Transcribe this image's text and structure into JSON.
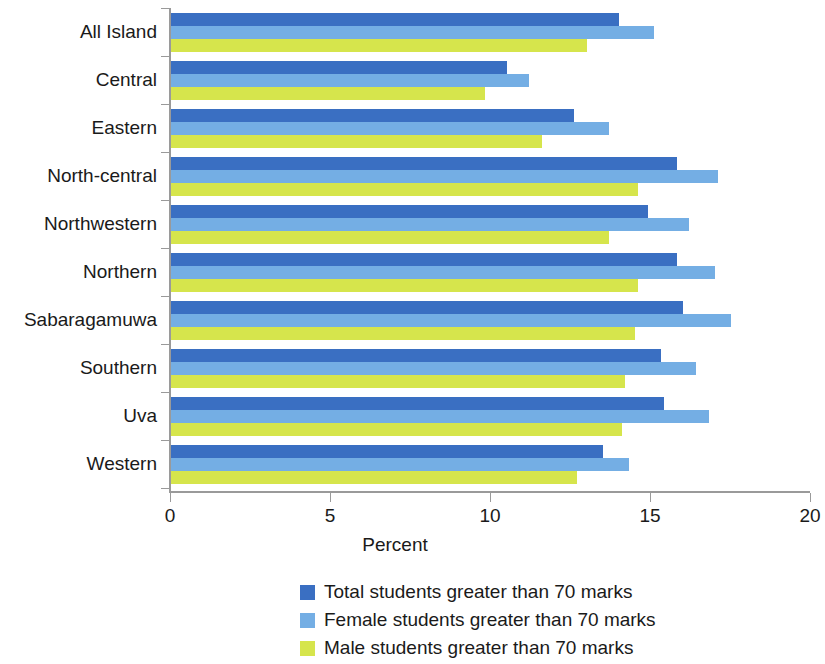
{
  "chart_data": {
    "type": "bar",
    "orientation": "horizontal",
    "title": "",
    "xlabel": "Percent",
    "ylabel": "",
    "xlim": [
      0,
      20
    ],
    "xticks": [
      0,
      5,
      10,
      15,
      20
    ],
    "xtick_labels": [
      "0",
      "5",
      "10",
      "15",
      "20"
    ],
    "grid": false,
    "legend_position": "bottom",
    "categories": [
      "All Island",
      "Central",
      "Eastern",
      "North-central",
      "Northwestern",
      "Northern",
      "Sabaragamuwa",
      "Southern",
      "Uva",
      "Western"
    ],
    "series": [
      {
        "name": "Total students greater than 70 marks",
        "color": "#3a6fc2",
        "values": [
          14.0,
          10.5,
          12.6,
          15.8,
          14.9,
          15.8,
          16.0,
          15.3,
          15.4,
          13.5
        ]
      },
      {
        "name": "Female students greater than 70 marks",
        "color": "#74aee4",
        "values": [
          15.1,
          11.2,
          13.7,
          17.1,
          16.2,
          17.0,
          17.5,
          16.4,
          16.8,
          14.3
        ]
      },
      {
        "name": "Male students greater than 70 marks",
        "color": "#d6e54c",
        "values": [
          13.0,
          9.8,
          11.6,
          14.6,
          13.7,
          14.6,
          14.5,
          14.2,
          14.1,
          12.7
        ]
      }
    ]
  }
}
